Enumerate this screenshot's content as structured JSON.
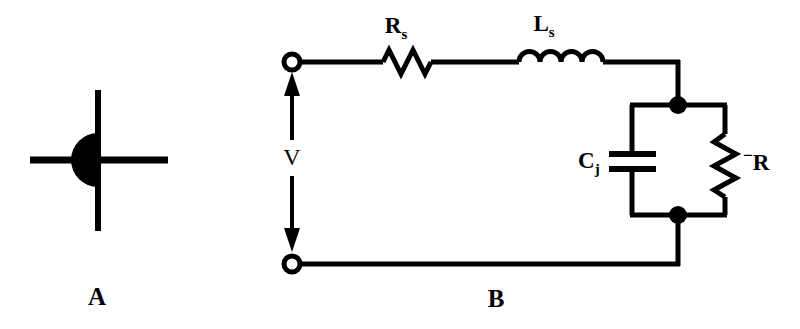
{
  "figure": {
    "background_color": "#ffffff",
    "ink_color": "#000000",
    "panels": [
      {
        "id": "A",
        "letter": "A",
        "caption": "A",
        "content": "tunnel-diode-symbol",
        "symbol_name": "tunnel-diode"
      },
      {
        "id": "B",
        "letter": "B",
        "caption": "B",
        "content": "equivalent-circuit"
      }
    ]
  },
  "panel_a": {
    "label": "A",
    "symbol": {
      "name": "tunnel-diode-symbol",
      "parts": [
        "vertical-bar",
        "filled-half-disc",
        "left-lead",
        "right-lead"
      ]
    }
  },
  "panel_b": {
    "label": "B",
    "source": {
      "name": "voltage-source",
      "label": "V",
      "arrow_style": "double-headed-vertical"
    },
    "terminals": [
      {
        "name": "top-terminal",
        "style": "open-circle"
      },
      {
        "name": "bottom-terminal",
        "style": "open-circle"
      }
    ],
    "components": [
      {
        "id": "rs",
        "symbol": "resistor",
        "orientation": "horizontal",
        "branch": "series",
        "label_main": "R",
        "label_sub": "s",
        "label_sup": "",
        "label_text": "Rs"
      },
      {
        "id": "ls",
        "symbol": "inductor",
        "orientation": "horizontal",
        "branch": "series",
        "label_main": "L",
        "label_sub": "s",
        "label_sup": "",
        "label_text": "Ls"
      },
      {
        "id": "cj",
        "symbol": "capacitor",
        "orientation": "vertical",
        "branch": "parallel-left",
        "label_main": "C",
        "label_sub": "j",
        "label_sup": "",
        "label_text": "Cj"
      },
      {
        "id": "negr",
        "symbol": "resistor",
        "orientation": "vertical",
        "branch": "parallel-right",
        "label_main": "R",
        "label_sub": "",
        "label_sup": "−",
        "label_text": "-R"
      }
    ],
    "junctions": [
      {
        "name": "top-junction-dot",
        "style": "filled-dot"
      },
      {
        "name": "bottom-junction-dot",
        "style": "filled-dot"
      }
    ]
  }
}
